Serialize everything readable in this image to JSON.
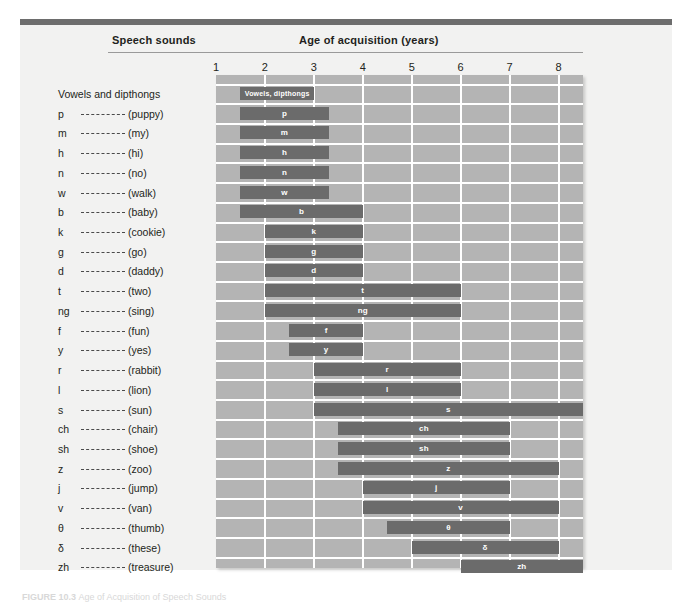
{
  "figure": {
    "caption_label": "FIGURE 10.3",
    "caption_text": "Age of Acquisition of Speech Sounds"
  },
  "header": {
    "speech_sounds": "Speech sounds",
    "age_of_acquisition": "Age of acquisition (years)"
  },
  "chart_data": {
    "type": "bar",
    "title": "Age of Acquisition of Speech Sounds",
    "xlabel": "Age of acquisition (years)",
    "ylabel": "Speech sounds",
    "xlim": [
      1,
      8.5
    ],
    "ticks": [
      "1",
      "2",
      "3",
      "4",
      "5",
      "6",
      "7",
      "8"
    ],
    "tick_values": [
      1,
      2,
      3,
      4,
      5,
      6,
      7,
      8
    ],
    "grid": true,
    "legend": "none",
    "orientation": "horizontal-range",
    "categories": [
      {
        "symbol": "",
        "word": "",
        "label": "Vowels and dipthongs",
        "bar_label": "Vowels, dipthongs",
        "start": 1.5,
        "end": 3.0
      },
      {
        "symbol": "p",
        "word": "(puppy)",
        "bar_label": "p",
        "start": 1.5,
        "end": 3.3
      },
      {
        "symbol": "m",
        "word": "(my)",
        "bar_label": "m",
        "start": 1.5,
        "end": 3.3
      },
      {
        "symbol": "h",
        "word": "(hi)",
        "bar_label": "h",
        "start": 1.5,
        "end": 3.3
      },
      {
        "symbol": "n",
        "word": "(no)",
        "bar_label": "n",
        "start": 1.5,
        "end": 3.3
      },
      {
        "symbol": "w",
        "word": "(walk)",
        "bar_label": "w",
        "start": 1.5,
        "end": 3.3
      },
      {
        "symbol": "b",
        "word": "(baby)",
        "bar_label": "b",
        "start": 1.5,
        "end": 4.0
      },
      {
        "symbol": "k",
        "word": "(cookie)",
        "bar_label": "k",
        "start": 2.0,
        "end": 4.0
      },
      {
        "symbol": "g",
        "word": "(go)",
        "bar_label": "g",
        "start": 2.0,
        "end": 4.0
      },
      {
        "symbol": "d",
        "word": "(daddy)",
        "bar_label": "d",
        "start": 2.0,
        "end": 4.0
      },
      {
        "symbol": "t",
        "word": "(two)",
        "bar_label": "t",
        "start": 2.0,
        "end": 6.0
      },
      {
        "symbol": "ng",
        "word": "(sing)",
        "bar_label": "ng",
        "start": 2.0,
        "end": 6.0
      },
      {
        "symbol": "f",
        "word": "(fun)",
        "bar_label": "f",
        "start": 2.5,
        "end": 4.0
      },
      {
        "symbol": "y",
        "word": "(yes)",
        "bar_label": "y",
        "start": 2.5,
        "end": 4.0
      },
      {
        "symbol": "r",
        "word": "(rabbit)",
        "bar_label": "r",
        "start": 3.0,
        "end": 6.0
      },
      {
        "symbol": "l",
        "word": "(lion)",
        "bar_label": "l",
        "start": 3.0,
        "end": 6.0
      },
      {
        "symbol": "s",
        "word": "(sun)",
        "bar_label": "s",
        "start": 3.0,
        "end": 8.5
      },
      {
        "symbol": "ch",
        "word": "(chair)",
        "bar_label": "ch",
        "start": 3.5,
        "end": 7.0
      },
      {
        "symbol": "sh",
        "word": "(shoe)",
        "bar_label": "sh",
        "start": 3.5,
        "end": 7.0
      },
      {
        "symbol": "z",
        "word": "(zoo)",
        "bar_label": "z",
        "start": 3.5,
        "end": 8.0
      },
      {
        "symbol": "j",
        "word": "(jump)",
        "bar_label": "j",
        "start": 4.0,
        "end": 7.0
      },
      {
        "symbol": "v",
        "word": "(van)",
        "bar_label": "v",
        "start": 4.0,
        "end": 8.0
      },
      {
        "symbol": "θ",
        "word": "(thumb)",
        "bar_label": "θ",
        "start": 4.5,
        "end": 7.0
      },
      {
        "symbol": "δ",
        "word": "(these)",
        "bar_label": "δ",
        "start": 5.0,
        "end": 8.0
      },
      {
        "symbol": "zh",
        "word": "(treasure)",
        "bar_label": "zh",
        "start": 6.0,
        "end": 8.5
      }
    ],
    "colors": {
      "bar": "#6b6b6b",
      "plot_background": "#b4b4b4",
      "gridline": "#ffffff",
      "panel_background": "#f2f2f1",
      "top_rule": "#6d6d6d",
      "bar_label_text": "#ffffff"
    }
  }
}
